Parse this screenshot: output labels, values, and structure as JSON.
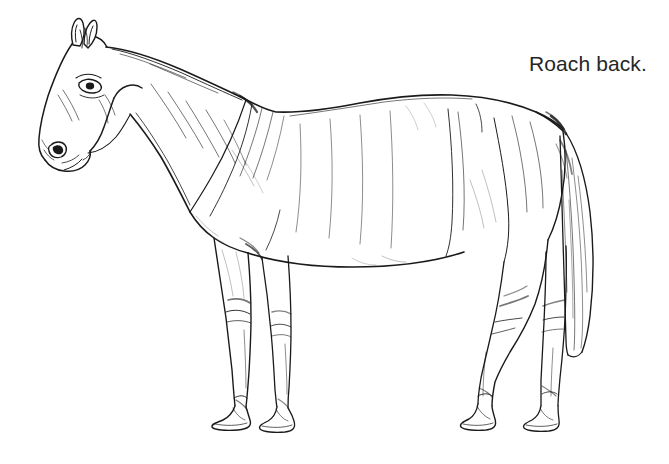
{
  "page": {
    "width": 669,
    "height": 464,
    "background_color": "#ffffff",
    "ink_color": "#1a1a1a",
    "medium": "pen-and-ink line drawing"
  },
  "caption": {
    "text": "Roach back.",
    "color": "#262626",
    "x": 529,
    "y": 52,
    "font_size_px": 21
  },
  "illustration": {
    "subject": "horse",
    "view": "left side profile, standing, facing left",
    "conformation_fault": "roach back",
    "description": "Line drawing of a standing horse in left profile with a convex arched topline over the loin, illustrating a roach back.",
    "parts": [
      "ear",
      "forelock",
      "eye",
      "muzzle",
      "nostril",
      "jaw",
      "throatlatch",
      "neck",
      "crest",
      "mane",
      "withers",
      "shoulder",
      "chest",
      "elbow",
      "forearm",
      "knee",
      "cannon",
      "fetlock",
      "pastern",
      "hoof",
      "barrel",
      "ribs",
      "flank",
      "belly",
      "back",
      "loin",
      "croup",
      "hip",
      "stifle",
      "gaskin",
      "hock",
      "tail"
    ]
  }
}
